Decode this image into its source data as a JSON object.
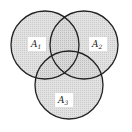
{
  "diagram": {
    "type": "venn",
    "sets": [
      {
        "label": "A",
        "subscript": "1",
        "cx": 45,
        "cy": 45,
        "r": 34,
        "label_x": 37,
        "label_y": 47
      },
      {
        "label": "A",
        "subscript": "2",
        "cx": 84,
        "cy": 45,
        "r": 34,
        "label_x": 98,
        "label_y": 47
      },
      {
        "label": "A",
        "subscript": "3",
        "cx": 69,
        "cy": 85,
        "r": 34,
        "label_x": 64,
        "label_y": 103
      }
    ],
    "colors": {
      "fill": "#cfcfcf",
      "stroke": "#222222",
      "label_bg": "#ffffff"
    }
  }
}
